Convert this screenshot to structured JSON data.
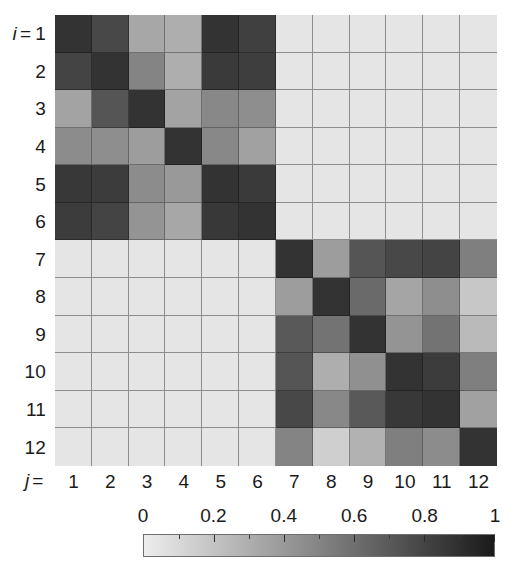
{
  "figure": {
    "kind": "matrix-heatmap",
    "row_axis_prefix": "i",
    "row_axis_equals": "=",
    "col_axis_prefix": "j",
    "col_axis_equals": "="
  },
  "row_labels": [
    "1",
    "2",
    "3",
    "4",
    "5",
    "6",
    "7",
    "8",
    "9",
    "10",
    "11",
    "12"
  ],
  "col_labels": [
    "1",
    "2",
    "3",
    "4",
    "5",
    "6",
    "7",
    "8",
    "9",
    "10",
    "11",
    "12"
  ],
  "colorbar": {
    "tick_labels": [
      "0",
      "0.2",
      "0.4",
      "0.6",
      "0.8",
      "1"
    ],
    "tick_values": [
      0,
      0.2,
      0.4,
      0.6,
      0.8,
      1
    ],
    "min_color": "#ededed",
    "max_color": "#1a1a1a",
    "orientation": "horizontal"
  },
  "chart_data": {
    "type": "heatmap",
    "title": "",
    "xlabel": "j",
    "ylabel": "i",
    "grid": true,
    "legend": "colorbar-bottom",
    "colormap": "grayscale-reversed",
    "vmin": 0,
    "vmax": 1,
    "x": [
      1,
      2,
      3,
      4,
      5,
      6,
      7,
      8,
      9,
      10,
      11,
      12
    ],
    "y": [
      1,
      2,
      3,
      4,
      5,
      6,
      7,
      8,
      9,
      10,
      11,
      12
    ],
    "xtick_labels": [
      "1",
      "2",
      "3",
      "4",
      "5",
      "6",
      "7",
      "8",
      "9",
      "10",
      "11",
      "12"
    ],
    "ytick_labels": [
      "1",
      "2",
      "3",
      "4",
      "5",
      "6",
      "7",
      "8",
      "9",
      "10",
      "11",
      "12"
    ],
    "block_structure": "two communities: rows/cols 1-6 and rows/cols 7-12; off-diagonal blocks near zero",
    "values": [
      [
        0.88,
        0.78,
        0.33,
        0.3,
        0.88,
        0.82,
        0.04,
        0.04,
        0.04,
        0.04,
        0.04,
        0.04
      ],
      [
        0.8,
        0.88,
        0.5,
        0.3,
        0.85,
        0.83,
        0.04,
        0.04,
        0.04,
        0.04,
        0.04,
        0.04
      ],
      [
        0.35,
        0.72,
        0.88,
        0.35,
        0.48,
        0.45,
        0.04,
        0.04,
        0.04,
        0.04,
        0.04,
        0.04
      ],
      [
        0.46,
        0.45,
        0.38,
        0.88,
        0.48,
        0.36,
        0.04,
        0.04,
        0.04,
        0.04,
        0.04,
        0.04
      ],
      [
        0.86,
        0.84,
        0.46,
        0.4,
        0.88,
        0.85,
        0.04,
        0.04,
        0.04,
        0.04,
        0.04,
        0.04
      ],
      [
        0.84,
        0.8,
        0.42,
        0.33,
        0.86,
        0.88,
        0.04,
        0.04,
        0.04,
        0.04,
        0.04,
        0.04
      ],
      [
        0.04,
        0.04,
        0.04,
        0.04,
        0.04,
        0.04,
        0.88,
        0.38,
        0.72,
        0.78,
        0.8,
        0.52
      ],
      [
        0.04,
        0.04,
        0.04,
        0.04,
        0.04,
        0.04,
        0.38,
        0.88,
        0.62,
        0.34,
        0.45,
        0.18
      ],
      [
        0.04,
        0.04,
        0.04,
        0.04,
        0.04,
        0.04,
        0.7,
        0.58,
        0.88,
        0.42,
        0.58,
        0.24
      ],
      [
        0.04,
        0.04,
        0.04,
        0.04,
        0.04,
        0.04,
        0.72,
        0.3,
        0.44,
        0.88,
        0.84,
        0.52
      ],
      [
        0.04,
        0.04,
        0.04,
        0.04,
        0.04,
        0.04,
        0.78,
        0.48,
        0.7,
        0.86,
        0.88,
        0.36
      ],
      [
        0.04,
        0.04,
        0.04,
        0.04,
        0.04,
        0.04,
        0.5,
        0.14,
        0.28,
        0.52,
        0.46,
        0.88
      ]
    ]
  }
}
